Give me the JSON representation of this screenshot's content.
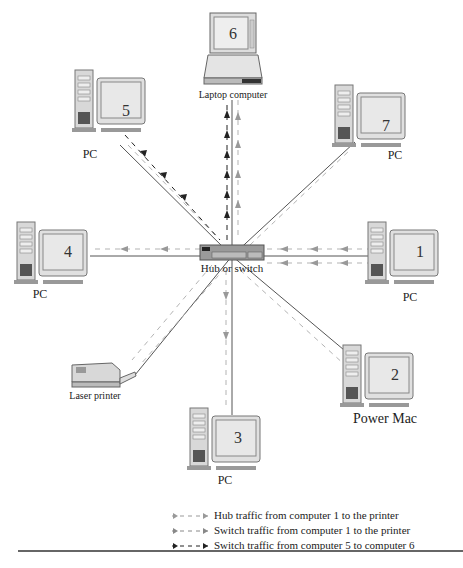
{
  "hub": {
    "label": "Hub or switch"
  },
  "nodes": [
    {
      "id": "1",
      "number": "1",
      "label": "PC"
    },
    {
      "id": "2",
      "number": "2",
      "label": "Power Mac"
    },
    {
      "id": "3",
      "number": "3",
      "label": "PC"
    },
    {
      "id": "4",
      "number": "4",
      "label": "PC"
    },
    {
      "id": "5",
      "number": "5",
      "label": "PC"
    },
    {
      "id": "6",
      "number": "6",
      "label": "Laptop computer"
    },
    {
      "id": "7",
      "number": "7",
      "label": "PC"
    },
    {
      "id": "printer",
      "number": "",
      "label": "Laser printer"
    }
  ],
  "legend": [
    {
      "label": "Hub traffic from computer 1 to the printer",
      "color": "#999999"
    },
    {
      "label": "Switch traffic from computer 1 to the printer",
      "color": "#888888"
    },
    {
      "label": "Switch traffic from computer 5 to computer 6",
      "color": "#222222"
    }
  ],
  "colors": {
    "device_fill": "#d8d8d8",
    "screen_fill": "#e6e6e6",
    "line": "#555555",
    "hub_fill": "#999999"
  }
}
